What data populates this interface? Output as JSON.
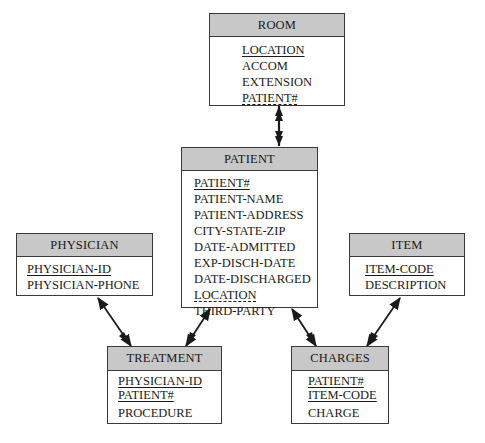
{
  "diagram": {
    "entities": {
      "room": {
        "title": "ROOM",
        "attributes": [
          {
            "name": "LOCATION",
            "key": "primary"
          },
          {
            "name": "ACCOM",
            "key": "none"
          },
          {
            "name": "EXTENSION",
            "key": "none"
          },
          {
            "name": "PATIENT#",
            "key": "foreign"
          }
        ]
      },
      "patient": {
        "title": "PATIENT",
        "attributes": [
          {
            "name": "PATIENT#",
            "key": "primary"
          },
          {
            "name": "PATIENT-NAME",
            "key": "none"
          },
          {
            "name": "PATIENT-ADDRESS",
            "key": "none"
          },
          {
            "name": "CITY-STATE-ZIP",
            "key": "none"
          },
          {
            "name": "DATE-ADMITTED",
            "key": "none"
          },
          {
            "name": "EXP-DISCH-DATE",
            "key": "none"
          },
          {
            "name": "DATE-DISCHARGED",
            "key": "none"
          },
          {
            "name": "LOCATION",
            "key": "foreign"
          },
          {
            "name": "THIRD-PARTY",
            "key": "none"
          }
        ]
      },
      "physician": {
        "title": "PHYSICIAN",
        "attributes": [
          {
            "name": "PHYSICIAN-ID",
            "key": "primary"
          },
          {
            "name": "PHYSICIAN-PHONE",
            "key": "none"
          }
        ]
      },
      "item": {
        "title": "ITEM",
        "attributes": [
          {
            "name": "ITEM-CODE",
            "key": "primary"
          },
          {
            "name": "DESCRIPTION",
            "key": "none"
          }
        ]
      },
      "treatment": {
        "title": "TREATMENT",
        "attributes": [
          {
            "name": "PHYSICIAN-ID",
            "key": "primary"
          },
          {
            "name": "PATIENT#",
            "key": "primary"
          },
          {
            "name": "PROCEDURE",
            "key": "none"
          }
        ]
      },
      "charges": {
        "title": "CHARGES",
        "attributes": [
          {
            "name": "PATIENT#",
            "key": "primary"
          },
          {
            "name": "ITEM-CODE",
            "key": "primary"
          },
          {
            "name": "CHARGE",
            "key": "none"
          }
        ]
      }
    },
    "relationships": [
      {
        "from": "ROOM",
        "to": "PATIENT",
        "type": "one-to-one"
      },
      {
        "from": "PHYSICIAN",
        "to": "TREATMENT",
        "type": "one-to-many"
      },
      {
        "from": "PATIENT",
        "to": "TREATMENT",
        "type": "one-to-many"
      },
      {
        "from": "PATIENT",
        "to": "CHARGES",
        "type": "one-to-many"
      },
      {
        "from": "ITEM",
        "to": "CHARGES",
        "type": "one-to-many"
      }
    ],
    "colors": {
      "header_fill": "#c8c8c8",
      "border": "#3a3a3a",
      "line": "#1a1a1a"
    }
  }
}
